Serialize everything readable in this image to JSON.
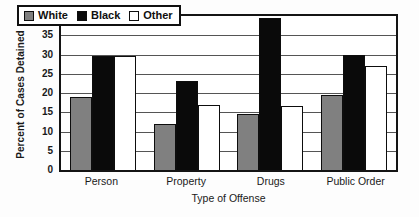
{
  "chart_data": {
    "type": "bar",
    "title": "",
    "xlabel": "Type of Offense",
    "ylabel": "Percent of Cases Detained",
    "categories": [
      "Person",
      "Property",
      "Drugs",
      "Public Order"
    ],
    "series": [
      {
        "name": "White",
        "values": [
          19,
          12,
          14.5,
          19.5
        ],
        "color": "#808080"
      },
      {
        "name": "Black",
        "values": [
          29.5,
          23,
          39.5,
          30
        ],
        "color": "#0a0a0a"
      },
      {
        "name": "Other",
        "values": [
          29.5,
          17,
          16.5,
          27
        ],
        "color": "#ffffff"
      }
    ],
    "ylim": [
      0,
      40
    ],
    "yticks": [
      0,
      5,
      10,
      15,
      20,
      25,
      30,
      35,
      40
    ],
    "ytick_labels": [
      "0",
      "5",
      "10",
      "15",
      "20",
      "25",
      "30",
      "35",
      "40"
    ],
    "grid": true,
    "legend_position": "upper-left-inside"
  }
}
